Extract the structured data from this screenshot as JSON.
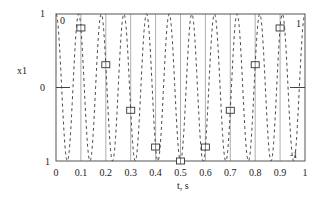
{
  "chart_data": {
    "type": "line",
    "title": "",
    "xlabel": "t, s",
    "ylabel": "x1",
    "xlim": [
      0,
      1
    ],
    "ylim": [
      -1,
      1
    ],
    "x_ticks": [
      "0",
      "0.1",
      "0.2",
      "0.3",
      "0.4",
      "0.5",
      "0.6",
      "0.7",
      "0.8",
      "0.9",
      "1"
    ],
    "y_ticks": [
      "1",
      "0",
      "1"
    ],
    "y_ticks_values": [
      1,
      0,
      -1
    ],
    "grid": {
      "vertical": true,
      "horizontal": false
    },
    "annotations": [
      {
        "text": "0",
        "position": "top-left inside plot"
      },
      {
        "text": "1",
        "position": "top-right inside plot"
      },
      {
        "text": "-1",
        "position": "bottom-right inside plot"
      }
    ],
    "series": [
      {
        "name": "continuous signal x1(t) = cos(2*pi*11*t)",
        "style": "dashed",
        "color": "#333333",
        "frequency_hz": 11,
        "function": "cos"
      },
      {
        "name": "samples",
        "style": "square-markers",
        "color": "#333333",
        "x": [
          0.1,
          0.2,
          0.3,
          0.4,
          0.5,
          0.6,
          0.7,
          0.8,
          0.9
        ],
        "values": [
          0.81,
          0.31,
          -0.31,
          -0.81,
          -1.0,
          -0.81,
          -0.31,
          0.31,
          0.81
        ]
      }
    ],
    "legend": null
  },
  "labels": {
    "ylabel": "x1",
    "xlabel": "t, s",
    "ytick_top": "1",
    "ytick_mid": "0",
    "ytick_bottom": "1",
    "corner_tl": "0",
    "corner_tr": "1",
    "corner_br": "-1"
  }
}
